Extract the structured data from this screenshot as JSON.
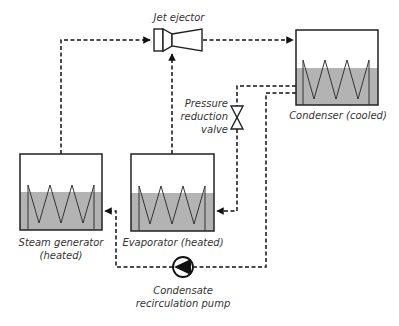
{
  "diagram": {
    "type": "process-flow",
    "colors": {
      "line": "#111111",
      "liquid_fill": "#b3b3b3",
      "label_text": "#333333",
      "background": "#ffffff"
    },
    "components": {
      "jet_ejector": {
        "label": "Jet ejector"
      },
      "condenser": {
        "label": "Condenser (cooled)"
      },
      "steam_generator": {
        "label_line1": "Steam generator",
        "label_line2": "(heated)"
      },
      "evaporator": {
        "label": "Evaporator (heated)"
      },
      "pressure_reduction_valve": {
        "label_line1": "Pressure",
        "label_line2": "reduction",
        "label_line3": "valve"
      },
      "pump": {
        "label_line1": "Condensate",
        "label_line2": "recirculation pump"
      }
    },
    "connections": [
      {
        "from": "Steam generator",
        "to": "Jet ejector",
        "style": "dashed"
      },
      {
        "from": "Evaporator",
        "to": "Jet ejector",
        "style": "dashed"
      },
      {
        "from": "Jet ejector",
        "to": "Condenser",
        "style": "dashed"
      },
      {
        "from": "Condenser",
        "to": "Pressure reduction valve",
        "style": "dashed"
      },
      {
        "from": "Pressure reduction valve",
        "to": "Evaporator",
        "style": "dashed"
      },
      {
        "from": "Condenser",
        "to": "Condensate recirculation pump",
        "style": "dashed"
      },
      {
        "from": "Condensate recirculation pump",
        "to": "Steam generator",
        "style": "dashed"
      }
    ]
  }
}
